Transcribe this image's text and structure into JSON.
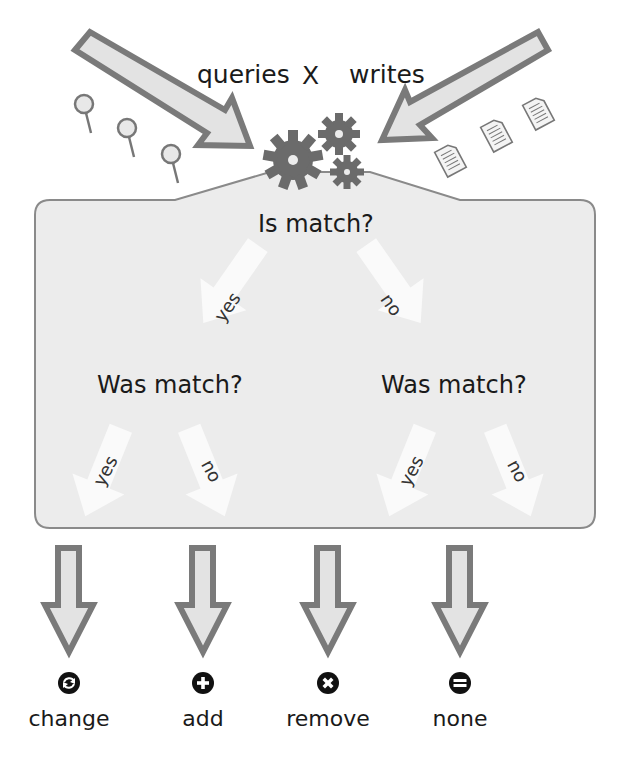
{
  "header": {
    "left_label": "queries",
    "operator": "X",
    "right_label": "writes"
  },
  "decision": {
    "root_question": "Is match?",
    "left_branch_label": "yes",
    "right_branch_label": "no",
    "left_question": "Was match?",
    "right_question": "Was match?",
    "leaf_branches": [
      "yes",
      "no",
      "yes",
      "no"
    ]
  },
  "outcomes": [
    {
      "label": "change",
      "icon": "refresh-circle-icon"
    },
    {
      "label": "add",
      "icon": "plus-circle-icon"
    },
    {
      "label": "remove",
      "icon": "x-circle-icon"
    },
    {
      "label": "none",
      "icon": "equals-circle-icon"
    }
  ],
  "colors": {
    "arrow_fill": "#e3e3e3",
    "arrow_stroke": "#7a7a7a",
    "gear": "#6b6b6b",
    "box_fill": "#ececec",
    "box_stroke": "#8a8a8a"
  }
}
